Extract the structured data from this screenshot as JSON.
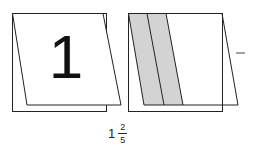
{
  "left_card": {
    "digit": "1"
  },
  "right_card": {
    "total_strips": 5,
    "shaded_strips": 2,
    "shade_color": "#d3d3d3"
  },
  "operator": "–",
  "answer": {
    "whole": "1",
    "numerator": "2",
    "denominator": "5"
  },
  "colors": {
    "line": "#222222",
    "background": "#ffffff"
  }
}
